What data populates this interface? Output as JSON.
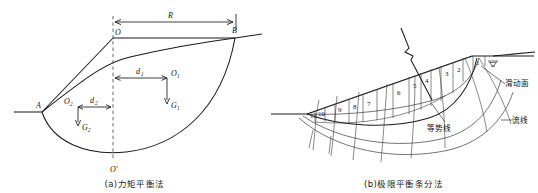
{
  "figure": {
    "panels": [
      {
        "id": "a",
        "caption": "(a)力矩平衡法",
        "caption_meaning": "Moment equilibrium method",
        "labels": {
          "radius": "R",
          "center_top": "O",
          "center_bottom": "O'",
          "toe": "A",
          "crest": "B",
          "arm_1": "d",
          "arm_1_sub": "1",
          "arm_2": "d",
          "arm_2_sub": "2",
          "centroid_1": "O",
          "centroid_1_sub": "1",
          "centroid_2": "O",
          "centroid_2_sub": "2",
          "weight_1": "G",
          "weight_1_sub": "1",
          "weight_2": "G",
          "weight_2_sub": "2"
        }
      },
      {
        "id": "b",
        "caption": "(b)极限平衡条分法",
        "caption_meaning": "Limit equilibrium method of slices",
        "slice_numbers": [
          "1",
          "2",
          "3",
          "4",
          "5",
          "6",
          "7",
          "8",
          "9",
          "10",
          "11"
        ],
        "annotations": {
          "slip_surface": "滑动面",
          "equipotential_line": "等势线",
          "flow_line": "流线"
        },
        "symbols": {
          "water_table": "water-table-icon",
          "break_line": "break-line-icon"
        }
      }
    ]
  },
  "colors": {
    "ink": "#1a1a1a",
    "thin_ink": "#2a2a2a",
    "dashed": "#444444",
    "background": "#ffffff"
  }
}
